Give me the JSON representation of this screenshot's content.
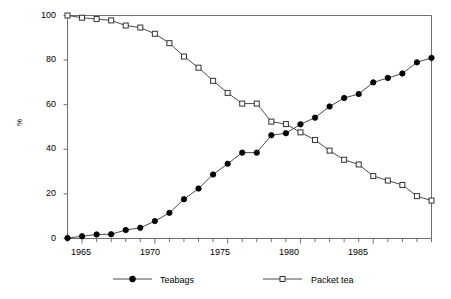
{
  "chart_data": {
    "type": "line",
    "title": "",
    "xlabel": "",
    "ylabel": "%",
    "xlim": [
      1964,
      1989
    ],
    "ylim": [
      0,
      100
    ],
    "grid": false,
    "legend_position": "bottom",
    "xticks": [
      "1965",
      "1970",
      "1975",
      "1980",
      "1985"
    ],
    "xtick_values": [
      1965,
      1970,
      1975,
      1980,
      1985
    ],
    "yticks": [
      "0",
      "20",
      "40",
      "60",
      "80",
      "100"
    ],
    "ytick_values": [
      0,
      20,
      40,
      60,
      80,
      100
    ],
    "x": [
      1964,
      1965,
      1966,
      1967,
      1968,
      1969,
      1970,
      1971,
      1972,
      1973,
      1974,
      1975,
      1976,
      1977,
      1978,
      1979,
      1980,
      1981,
      1982,
      1983,
      1984,
      1985,
      1986,
      1987,
      1988,
      1989
    ],
    "series": [
      {
        "name": "Teabags",
        "marker": "filled-circle",
        "values": [
          0.2,
          1.0,
          1.8,
          1.9,
          3.8,
          4.8,
          7.8,
          11.5,
          17.6,
          22.4,
          28.7,
          33.5,
          38.5,
          38.5,
          46.3,
          47.2,
          51.2,
          54.2,
          59.2,
          63.0,
          64.8,
          70.0,
          72.0,
          74.0,
          79.0,
          81.0
        ]
      },
      {
        "name": "Packet tea",
        "marker": "open-square",
        "values": [
          100.0,
          99.0,
          98.4,
          97.8,
          95.5,
          94.6,
          91.8,
          87.6,
          81.6,
          76.6,
          70.7,
          65.3,
          60.5,
          60.5,
          52.4,
          51.3,
          47.6,
          44.2,
          39.4,
          35.3,
          33.2,
          28.0,
          26.0,
          24.0,
          19.0,
          17.0
        ]
      }
    ]
  },
  "legend": {
    "items": [
      {
        "label": "Teabags"
      },
      {
        "label": "Packet tea"
      }
    ]
  },
  "colors": {
    "line": "#4a4a4a",
    "marker_fill": "#000000",
    "marker_open": "#ffffff",
    "axis": "#6f6f6f",
    "text": "#000000"
  }
}
